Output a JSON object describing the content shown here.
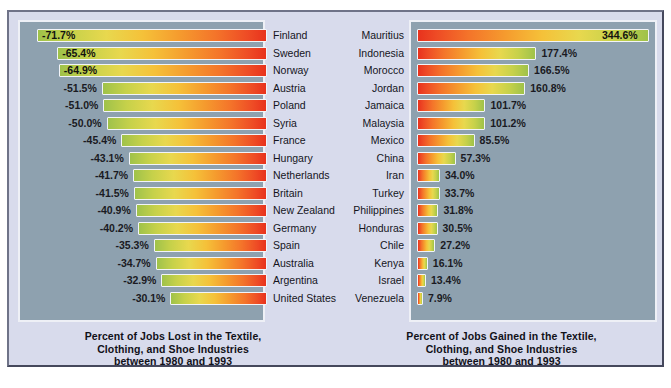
{
  "chart_data": [
    {
      "type": "bar",
      "title": "Percent of Jobs Lost in the Textile, Clothing, and Shoe Industries between 1980 and 1993",
      "title_lines": [
        "Percent of Jobs Lost in the Textile,",
        "Clothing, and Shoe Industries",
        "between 1980 and 1993"
      ],
      "orientation": "horizontal",
      "xlabel": "",
      "ylabel": "",
      "grid": false,
      "legend": "none",
      "axis_range": [
        -75,
        0
      ],
      "categories": [
        "Finland",
        "Sweden",
        "Norway",
        "Austria",
        "Poland",
        "Syria",
        "France",
        "Hungary",
        "Netherlands",
        "Britain",
        "New Zealand",
        "Germany",
        "Spain",
        "Australia",
        "Argentina",
        "United States"
      ],
      "values": [
        -71.7,
        -65.4,
        -64.9,
        -51.5,
        -51.0,
        -50.0,
        -45.4,
        -43.1,
        -41.7,
        -41.5,
        -40.9,
        -40.2,
        -35.3,
        -34.7,
        -32.9,
        -30.1
      ],
      "value_labels": [
        "-71.7%",
        "-65.4%",
        "-64.9%",
        "-51.5%",
        "-51.0%",
        "-50.0%",
        "-45.4%",
        "-43.1%",
        "-41.7%",
        "-41.5%",
        "-40.9%",
        "-40.2%",
        "-35.3%",
        "-34.7%",
        "-32.9%",
        "-30.1%"
      ],
      "label_inside": [
        true,
        true,
        true,
        false,
        false,
        false,
        false,
        false,
        false,
        false,
        false,
        false,
        false,
        false,
        false,
        false
      ]
    },
    {
      "type": "bar",
      "title": "Percent of Jobs Gained in the Textile, Clothing, and Shoe Industries between 1980 and 1993",
      "title_lines": [
        "Percent of Jobs Gained in the Textile,",
        "Clothing, and Shoe Industries",
        "between 1980 and 1993"
      ],
      "orientation": "horizontal",
      "xlabel": "",
      "ylabel": "",
      "grid": false,
      "legend": "none",
      "axis_range": [
        0,
        360
      ],
      "categories": [
        "Mauritius",
        "Indonesia",
        "Morocco",
        "Jordan",
        "Jamaica",
        "Malaysia",
        "Mexico",
        "China",
        "Iran",
        "Turkey",
        "Philippines",
        "Honduras",
        "Chile",
        "Kenya",
        "Israel",
        "Venezuela"
      ],
      "values": [
        344.6,
        177.4,
        166.5,
        160.8,
        101.7,
        101.2,
        85.5,
        57.3,
        34.0,
        33.7,
        31.8,
        30.5,
        27.2,
        16.1,
        13.4,
        7.9
      ],
      "value_labels": [
        "344.6%",
        "177.4%",
        "166.5%",
        "160.8%",
        "101.7%",
        "101.2%",
        "85.5%",
        "57.3%",
        "34.0%",
        "33.7%",
        "31.8%",
        "30.5%",
        "27.2%",
        "16.1%",
        "13.4%",
        "7.9%"
      ],
      "label_inside": [
        true,
        false,
        false,
        false,
        false,
        false,
        false,
        false,
        false,
        false,
        false,
        false,
        false,
        false,
        false,
        false
      ]
    }
  ],
  "colors": {
    "figure_background": "#d8dbec",
    "plot_background": "#8ea1af",
    "bar_low": "#e8321d",
    "bar_mid": "#f5c139",
    "bar_high": "#9fc24a",
    "bar_outline": "#f2f4f8",
    "text": "#15151c"
  }
}
